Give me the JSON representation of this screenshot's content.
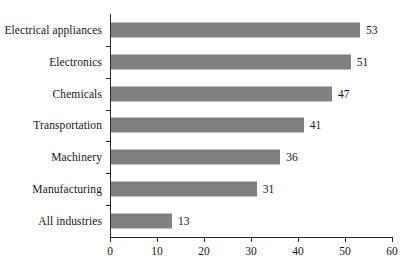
{
  "chart_data": {
    "type": "bar",
    "orientation": "horizontal",
    "title": "",
    "subtitle": "",
    "xlabel": "",
    "ylabel": "",
    "categories": [
      "Electrical appliances",
      "Electronics",
      "Chemicals",
      "Transportation",
      "Machinery",
      "Manufacturing",
      "All industries"
    ],
    "values": [
      53,
      51,
      47,
      41,
      36,
      31,
      13
    ],
    "data_labels": [
      "53",
      "51",
      "47",
      "41",
      "36",
      "31",
      "13"
    ],
    "xlim": [
      0,
      60
    ],
    "xticks": [
      0,
      10,
      20,
      30,
      40,
      50,
      60
    ],
    "xtick_labels": [
      "0",
      "10",
      "20",
      "30",
      "40",
      "50",
      "60"
    ],
    "grid": false,
    "legend": null,
    "bar_color": "#808080",
    "axis_color": "#2b2b2b",
    "background_color": "#ffffff"
  }
}
